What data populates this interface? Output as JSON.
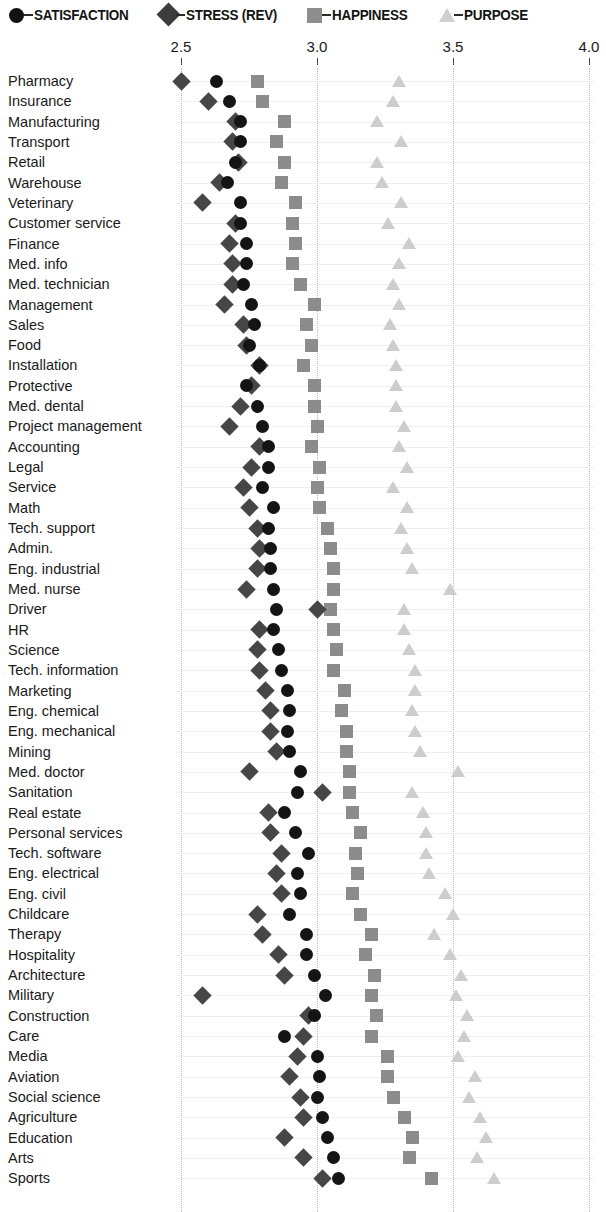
{
  "legend": {
    "items": [
      {
        "key": "satisfaction",
        "label": "SATISFACTION",
        "marker": "circle-marker",
        "color": "#141414"
      },
      {
        "key": "stress",
        "label": "STRESS (REV)",
        "marker": "diamond-marker",
        "color": "#464646"
      },
      {
        "key": "happiness",
        "label": "HAPPINESS",
        "marker": "square-marker",
        "color": "#8c8c8c"
      },
      {
        "key": "purpose",
        "label": "PURPOSE",
        "marker": "triangle-marker",
        "color": "#cdcdcd"
      }
    ]
  },
  "axis": {
    "ticks": [
      "2.5",
      "3.0",
      "3.5",
      "4.0"
    ],
    "tick_values": [
      2.5,
      3.0,
      3.5,
      4.0
    ],
    "min": 2.35,
    "max": 4.06
  },
  "chart_data": {
    "type": "scatter",
    "plot_style": "dot-plot",
    "title": "",
    "subtitle": "",
    "xlabel": "",
    "ylabel": "",
    "xlim": [
      2.35,
      4.06
    ],
    "xticks": [
      2.5,
      3.0,
      3.5,
      4.0
    ],
    "grid": "vertical-dotted",
    "legend_position": "top",
    "categories": [
      "Pharmacy",
      "Insurance",
      "Manufacturing",
      "Transport",
      "Retail",
      "Warehouse",
      "Veterinary",
      "Customer service",
      "Finance",
      "Med. info",
      "Med. technician",
      "Management",
      "Sales",
      "Food",
      "Installation",
      "Protective",
      "Med. dental",
      "Project management",
      "Accounting",
      "Legal",
      "Service",
      "Math",
      "Tech. support",
      "Admin.",
      "Eng. industrial",
      "Med. nurse",
      "Driver",
      "HR",
      "Science",
      "Tech. information",
      "Marketing",
      "Eng. chemical",
      "Eng. mechanical",
      "Mining",
      "Med. doctor",
      "Sanitation",
      "Real estate",
      "Personal services",
      "Tech. software",
      "Eng. electrical",
      "Eng. civil",
      "Childcare",
      "Therapy",
      "Hospitality",
      "Architecture",
      "Military",
      "Construction",
      "Care",
      "Media",
      "Aviation",
      "Social science",
      "Agriculture",
      "Education",
      "Arts",
      "Sports"
    ],
    "series": [
      {
        "name": "SATISFACTION",
        "key": "satisfaction",
        "marker": "circle",
        "color": "#141414",
        "values": [
          2.63,
          2.68,
          2.72,
          2.72,
          2.7,
          2.67,
          2.72,
          2.72,
          2.74,
          2.74,
          2.73,
          2.76,
          2.77,
          2.75,
          2.79,
          2.74,
          2.78,
          2.8,
          2.82,
          2.82,
          2.8,
          2.84,
          2.82,
          2.83,
          2.83,
          2.84,
          2.85,
          2.84,
          2.86,
          2.87,
          2.89,
          2.9,
          2.89,
          2.9,
          2.94,
          2.93,
          2.88,
          2.92,
          2.97,
          2.93,
          2.94,
          2.9,
          2.96,
          2.96,
          2.99,
          3.03,
          2.99,
          2.88,
          3.0,
          3.01,
          3.0,
          3.02,
          3.04,
          3.06,
          3.08
        ]
      },
      {
        "name": "STRESS (REV)",
        "key": "stress",
        "marker": "diamond",
        "color": "#464646",
        "values": [
          2.5,
          2.6,
          2.7,
          2.69,
          2.71,
          2.64,
          2.58,
          2.7,
          2.68,
          2.69,
          2.69,
          2.66,
          2.73,
          2.74,
          2.79,
          2.76,
          2.72,
          2.68,
          2.79,
          2.76,
          2.73,
          2.75,
          2.78,
          2.79,
          2.78,
          2.74,
          3.0,
          2.79,
          2.78,
          2.79,
          2.81,
          2.83,
          2.83,
          2.85,
          2.75,
          3.02,
          2.82,
          2.83,
          2.87,
          2.85,
          2.87,
          2.78,
          2.8,
          2.86,
          2.88,
          2.58,
          2.97,
          2.95,
          2.93,
          2.9,
          2.94,
          2.95,
          2.88,
          2.95,
          3.02
        ]
      },
      {
        "name": "HAPPINESS",
        "key": "happiness",
        "marker": "square",
        "color": "#8c8c8c",
        "values": [
          2.78,
          2.8,
          2.88,
          2.85,
          2.88,
          2.87,
          2.92,
          2.91,
          2.92,
          2.91,
          2.94,
          2.99,
          2.96,
          2.98,
          2.95,
          2.99,
          2.99,
          3.0,
          2.98,
          3.01,
          3.0,
          3.01,
          3.04,
          3.05,
          3.06,
          3.06,
          3.05,
          3.06,
          3.07,
          3.06,
          3.1,
          3.09,
          3.11,
          3.11,
          3.12,
          3.12,
          3.13,
          3.16,
          3.14,
          3.15,
          3.13,
          3.16,
          3.2,
          3.18,
          3.21,
          3.2,
          3.22,
          3.2,
          3.26,
          3.26,
          3.28,
          3.32,
          3.35,
          3.34,
          3.42
        ]
      },
      {
        "name": "PURPOSE",
        "key": "purpose",
        "marker": "triangle",
        "color": "#cdcdcd",
        "values": [
          3.3,
          3.28,
          3.22,
          3.31,
          3.22,
          3.24,
          3.31,
          3.26,
          3.34,
          3.3,
          3.28,
          3.3,
          3.27,
          3.28,
          3.29,
          3.29,
          3.29,
          3.32,
          3.3,
          3.33,
          3.28,
          3.33,
          3.31,
          3.33,
          3.35,
          3.49,
          3.32,
          3.32,
          3.34,
          3.36,
          3.36,
          3.35,
          3.36,
          3.38,
          3.52,
          3.35,
          3.39,
          3.4,
          3.4,
          3.41,
          3.47,
          3.5,
          3.43,
          3.49,
          3.53,
          3.51,
          3.55,
          3.54,
          3.52,
          3.58,
          3.56,
          3.6,
          3.62,
          3.59,
          3.65
        ]
      }
    ]
  }
}
